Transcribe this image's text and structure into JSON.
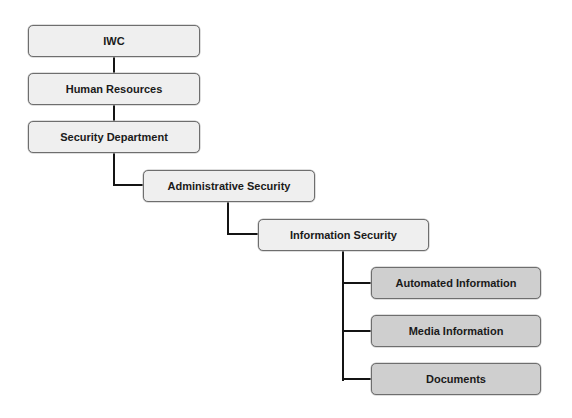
{
  "diagram": {
    "type": "org-hierarchy",
    "nodes": [
      {
        "id": "iwc",
        "label": "IWC",
        "level": 0,
        "shade": "light"
      },
      {
        "id": "hr",
        "label": "Human Resources",
        "level": 1,
        "shade": "light"
      },
      {
        "id": "secdept",
        "label": "Security Department",
        "level": 2,
        "shade": "light"
      },
      {
        "id": "adminsec",
        "label": "Administrative Security",
        "level": 3,
        "shade": "light"
      },
      {
        "id": "infosec",
        "label": "Information Security",
        "level": 4,
        "shade": "light"
      },
      {
        "id": "autoinfo",
        "label": "Automated Information",
        "level": 5,
        "shade": "dark"
      },
      {
        "id": "mediainfo",
        "label": "Media Information",
        "level": 5,
        "shade": "dark"
      },
      {
        "id": "docs",
        "label": "Documents",
        "level": 5,
        "shade": "dark"
      }
    ],
    "edges": [
      [
        "iwc",
        "hr"
      ],
      [
        "hr",
        "secdept"
      ],
      [
        "secdept",
        "adminsec"
      ],
      [
        "adminsec",
        "infosec"
      ],
      [
        "infosec",
        "autoinfo"
      ],
      [
        "infosec",
        "mediainfo"
      ],
      [
        "infosec",
        "docs"
      ]
    ],
    "colors": {
      "light_fill": "#efefef",
      "dark_fill": "#cfcfcf",
      "border": "#6e6e6e",
      "connector": "#141414"
    }
  }
}
